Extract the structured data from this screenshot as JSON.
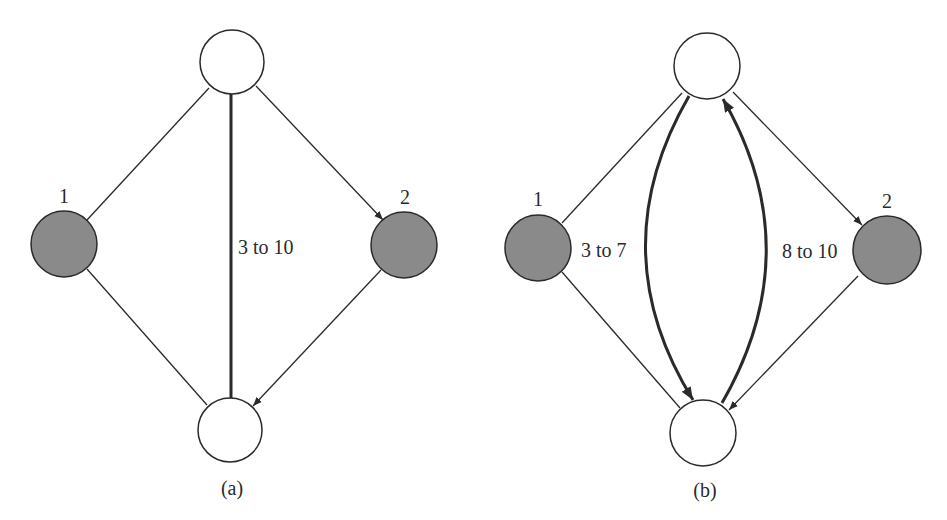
{
  "colors": {
    "background": "#ffffff",
    "stroke": "#2a2a2a",
    "shaded_node": "#8a8a8a",
    "plain_node": "#ffffff"
  },
  "panels": [
    {
      "id": "a",
      "caption": "(a)",
      "nodes": [
        {
          "id": "top",
          "label": "",
          "shaded": false
        },
        {
          "id": "n1",
          "label": "1",
          "shaded": true
        },
        {
          "id": "n2",
          "label": "2",
          "shaded": true
        },
        {
          "id": "bottom",
          "label": "",
          "shaded": false
        }
      ],
      "edges": [
        {
          "from": "top",
          "to": "n1",
          "directed": false,
          "thick": false
        },
        {
          "from": "n1",
          "to": "bottom",
          "directed": false,
          "thick": false
        },
        {
          "from": "top",
          "to": "n2",
          "directed": true,
          "thick": false
        },
        {
          "from": "n2",
          "to": "bottom",
          "directed": true,
          "thick": false
        },
        {
          "from": "top",
          "to": "bottom",
          "directed": false,
          "thick": true,
          "label": "3 to 10"
        }
      ]
    },
    {
      "id": "b",
      "caption": "(b)",
      "nodes": [
        {
          "id": "top",
          "label": "",
          "shaded": false
        },
        {
          "id": "n1",
          "label": "1",
          "shaded": true
        },
        {
          "id": "n2",
          "label": "2",
          "shaded": true
        },
        {
          "id": "bottom",
          "label": "",
          "shaded": false
        }
      ],
      "edges": [
        {
          "from": "top",
          "to": "n1",
          "directed": false,
          "thick": false
        },
        {
          "from": "n1",
          "to": "bottom",
          "directed": false,
          "thick": false
        },
        {
          "from": "top",
          "to": "n2",
          "directed": true,
          "thick": false
        },
        {
          "from": "n2",
          "to": "bottom",
          "directed": true,
          "thick": false
        },
        {
          "from": "top",
          "to": "bottom",
          "directed": true,
          "thick": true,
          "curved": "left",
          "label": "3 to 7"
        },
        {
          "from": "bottom",
          "to": "top",
          "directed": true,
          "thick": true,
          "curved": "right",
          "label": "8 to 10"
        }
      ]
    }
  ]
}
